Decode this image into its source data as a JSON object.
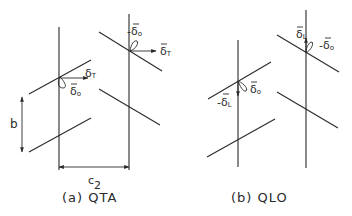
{
  "figure": {
    "panels": [
      {
        "id": "a",
        "caption": "(a) QTA",
        "labels": {
          "delta_T_left": "δ",
          "delta_T_left_sub": "T",
          "delta_o_left": "δ",
          "delta_o_left_sub": "o",
          "neg_delta_o_right": "-δ",
          "neg_delta_o_right_sub": "o",
          "delta_T_right": "δ",
          "delta_T_right_sub": "T",
          "pitch_b": "b",
          "spacing_c": "c",
          "spacing_c_sub": "2"
        }
      },
      {
        "id": "b",
        "caption": "(b) QLO",
        "labels": {
          "neg_delta_L_left": "-δ",
          "neg_delta_L_left_sub": "L",
          "delta_o_left": "δ",
          "delta_o_left_sub": "o",
          "delta_L_right": "δ",
          "delta_L_right_sub": "L",
          "neg_delta_o_right": "-δ",
          "neg_delta_o_right_sub": "o"
        }
      }
    ],
    "colors": {
      "ink": "#2a2a2a",
      "background": "#ffffff"
    }
  }
}
